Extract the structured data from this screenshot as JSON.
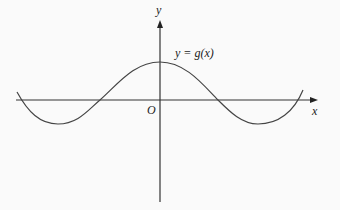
{
  "diagram": {
    "function_label": "y = g(x)",
    "x_axis_label": "x",
    "y_axis_label": "y",
    "origin_label": "O",
    "curve": {
      "shape": "cosine-like wave",
      "description": "maximum on the y-axis, crosses x-axis on both sides, minima on each side, rising at both ends"
    },
    "colors": {
      "axes": "#333333",
      "curve": "#444444",
      "background": "#fafafa"
    }
  }
}
